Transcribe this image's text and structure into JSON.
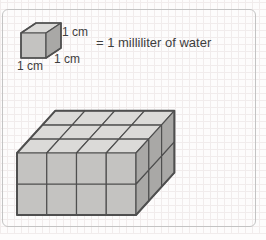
{
  "figure": {
    "labels": {
      "cube_top_edge": "1 cm",
      "cube_depth_edge": "1 cm",
      "cube_bottom_edge": "1 cm",
      "equivalence": "= 1 milliliter of water"
    },
    "unit_cube": {
      "dims": {
        "w": 1,
        "d": 1,
        "h": 1
      },
      "origin": {
        "x": 21,
        "y": 58
      },
      "unit": {
        "w": 25,
        "h": 25
      },
      "depth_vec": {
        "dx": 15,
        "dy": -10
      },
      "cell_stroke": 1.2,
      "outline_stroke": 1.6
    },
    "prism": {
      "dims": {
        "w": 4,
        "d": 3,
        "h": 2
      },
      "origin": {
        "x": 17,
        "y": 215
      },
      "unit": {
        "w": 29.75,
        "h": 31
      },
      "depth_vec": {
        "dx": 12.8,
        "dy": -14.1
      },
      "cell_stroke": 1.2,
      "outline_stroke": 2
    },
    "colors": {
      "face_top": "#dbdad8",
      "face_front": "#c4c3c1",
      "face_right": "#a9a8a6",
      "edge": "#4f4f4f",
      "frame_border": "#c3c3c3",
      "grid_line": "#f1ecec",
      "text": "#3e3e3e",
      "background": "#fdfcfc"
    }
  }
}
